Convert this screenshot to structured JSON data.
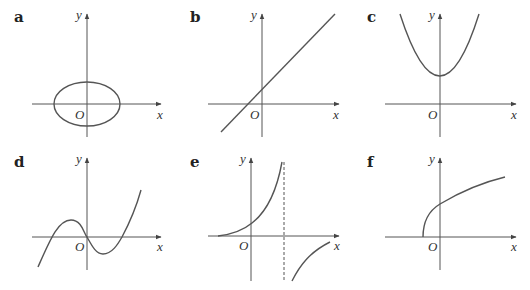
{
  "panels": [
    {
      "id": "a",
      "label": "a",
      "x_label": "x",
      "y_label": "y",
      "origin_label": "O",
      "curve": "ellipse centered at origin, wider than tall"
    },
    {
      "id": "b",
      "label": "b",
      "x_label": "x",
      "y_label": "y",
      "origin_label": "O",
      "curve": "straight line with positive gradient and positive y-intercept"
    },
    {
      "id": "c",
      "label": "c",
      "x_label": "x",
      "y_label": "y",
      "origin_label": "O",
      "curve": "upward parabola with minimum on positive y-axis"
    },
    {
      "id": "d",
      "label": "d",
      "x_label": "x",
      "y_label": "y",
      "origin_label": "O",
      "curve": "cubic through origin with three roots"
    },
    {
      "id": "e",
      "label": "e",
      "x_label": "x",
      "y_label": "y",
      "origin_label": "O",
      "curve": "rational/tangent-like curve with vertical asymptote (dashed)"
    },
    {
      "id": "f",
      "label": "f",
      "x_label": "x",
      "y_label": "y",
      "origin_label": "O",
      "curve": "square-root curve starting on negative x-axis"
    }
  ],
  "colors": {
    "stroke": "#555555",
    "text": "#333333",
    "background": "#ffffff"
  }
}
